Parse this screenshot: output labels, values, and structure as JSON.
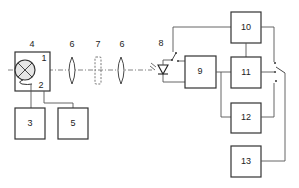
{
  "diagram": {
    "type": "optical-measurement-block-diagram",
    "blocks": [
      {
        "id": "4",
        "label": "4",
        "role": "lamp housing"
      },
      {
        "id": "1",
        "label": "1",
        "role": "lamp"
      },
      {
        "id": "2",
        "label": "2",
        "role": "lamp base/filament lead"
      },
      {
        "id": "3",
        "label": "3"
      },
      {
        "id": "5",
        "label": "5"
      },
      {
        "id": "6a",
        "label": "6",
        "role": "lens"
      },
      {
        "id": "7",
        "label": "7",
        "role": "sample (dashed)"
      },
      {
        "id": "6b",
        "label": "6",
        "role": "lens"
      },
      {
        "id": "8",
        "label": "8",
        "role": "photodiode with switch"
      },
      {
        "id": "9",
        "label": "9"
      },
      {
        "id": "10",
        "label": "10"
      },
      {
        "id": "11",
        "label": "11"
      },
      {
        "id": "12",
        "label": "12"
      },
      {
        "id": "13",
        "label": "13"
      }
    ],
    "labels": {
      "l1": "1",
      "l2": "2",
      "l3": "3",
      "l4": "4",
      "l5": "5",
      "l6a": "6",
      "l7": "7",
      "l6b": "6",
      "l8": "8",
      "l9": "9",
      "l10": "10",
      "l11": "11",
      "l12": "12",
      "l13": "13"
    },
    "colors": {
      "stroke": "#333333",
      "background": "#ffffff",
      "lamp_fill": "#e6e6e6"
    }
  }
}
